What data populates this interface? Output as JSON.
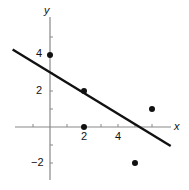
{
  "chart_data": {
    "type": "scatter",
    "title": "",
    "xlabel": "x",
    "ylabel": "y",
    "xlim": [
      -2,
      7
    ],
    "ylim": [
      -3,
      6
    ],
    "grid": false,
    "legend": null,
    "x_ticks": [
      -1,
      1,
      2,
      3,
      4,
      5,
      6
    ],
    "x_tick_labels": {
      "2": "2",
      "4": "4"
    },
    "y_ticks": [
      -2,
      -1,
      1,
      2,
      3,
      4,
      5
    ],
    "y_tick_labels": {
      "4": "4",
      "2": "2",
      "-2": "−2"
    },
    "series": [
      {
        "name": "points",
        "type": "scatter",
        "x": [
          0,
          2,
          2,
          5,
          6
        ],
        "y": [
          4,
          2,
          0,
          -2,
          1
        ]
      },
      {
        "name": "fitted line",
        "type": "line",
        "x": [
          -2.2,
          7.1
        ],
        "y": [
          4.3,
          -1.05
        ],
        "equation": "y ≈ 3 − 0.57x"
      }
    ]
  },
  "labels": {
    "x_axis": "x",
    "y_axis": "y",
    "tick_x_2": "2",
    "tick_x_4": "4",
    "tick_y_4": "4",
    "tick_y_2": "2",
    "tick_y_neg2": "−2"
  },
  "colors": {
    "axis": "#888888",
    "line": "#111111",
    "points": "#111111"
  }
}
